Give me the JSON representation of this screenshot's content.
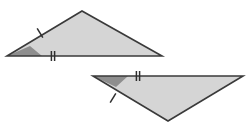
{
  "figure": {
    "type": "geometry-diagram",
    "description": "Two congruent shaded triangles with matching tick marks",
    "canvas": {
      "width": 251,
      "height": 129,
      "background": "#ffffff"
    },
    "colors": {
      "fill": "#d5d5d5",
      "outline": "#3a3a3a",
      "angle_wedge": "#8e8e8e",
      "tick": "#2e2e2e"
    },
    "shapes": [
      {
        "name": "upper-triangle",
        "label": "Upper triangle",
        "orientation": "apex-up",
        "vertices": [
          {
            "name": "left-vertex",
            "x": 7,
            "y": 56
          },
          {
            "name": "apex-vertex",
            "x": 82,
            "y": 11
          },
          {
            "name": "right-vertex",
            "x": 162,
            "y": 56
          }
        ],
        "angle_marker": {
          "name": "left-angle-wedge",
          "at_vertex": "left-vertex",
          "points": "7,56 42,56 30,46"
        },
        "marks": [
          {
            "name": "single-tick-left-side",
            "tick_count": 1,
            "side": "left-slant-side",
            "x": 40,
            "y": 33,
            "angle_deg": -31
          },
          {
            "name": "double-tick-base",
            "tick_count": 2,
            "side": "base-side",
            "x": 53,
            "y": 56,
            "angle_deg": 0
          }
        ]
      },
      {
        "name": "lower-triangle",
        "label": "Lower triangle",
        "orientation": "apex-down",
        "vertices": [
          {
            "name": "left-vertex",
            "x": 93,
            "y": 76
          },
          {
            "name": "right-vertex",
            "x": 243,
            "y": 76
          },
          {
            "name": "apex-vertex",
            "x": 168,
            "y": 121
          }
        ],
        "angle_marker": {
          "name": "left-angle-wedge",
          "at_vertex": "left-vertex",
          "points": "93,76 128,76 116,87"
        },
        "marks": [
          {
            "name": "double-tick-top-side",
            "tick_count": 2,
            "side": "top-side",
            "x": 138,
            "y": 76,
            "angle_deg": 0
          },
          {
            "name": "single-tick-left-side",
            "tick_count": 1,
            "side": "left-slant-side",
            "x": 113,
            "y": 98,
            "angle_deg": 31
          }
        ]
      }
    ]
  }
}
